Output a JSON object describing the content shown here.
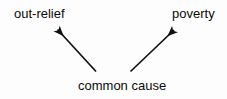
{
  "diagram": {
    "type": "common-cause-causal-diagram",
    "background_color": "#fdfdfd",
    "stroke_color": "#111111",
    "text_color": "#0a0a0a",
    "nodes": [
      {
        "id": "out-relief",
        "label": "out-relief",
        "position": "top-left"
      },
      {
        "id": "poverty",
        "label": "poverty",
        "position": "top-right"
      },
      {
        "id": "common-cause",
        "label": "common cause",
        "position": "bottom-center"
      }
    ],
    "edges": [
      {
        "id": "cause-to-out-relief",
        "from": "common cause",
        "to": "out-relief",
        "arrowhead": "filled-triangle",
        "direction": "up-left"
      },
      {
        "id": "cause-to-poverty",
        "from": "common cause",
        "to": "poverty",
        "arrowhead": "filled-triangle",
        "direction": "up-right"
      }
    ]
  }
}
